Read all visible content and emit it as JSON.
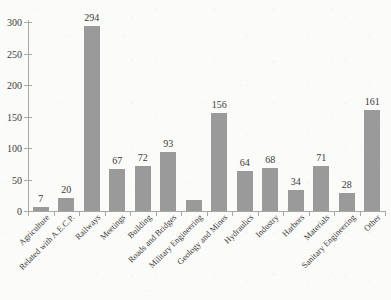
{
  "chart_data": {
    "type": "bar",
    "title": "",
    "xlabel": "",
    "ylabel": "",
    "ylim": [
      0,
      300
    ],
    "yticks": [
      0,
      50,
      100,
      150,
      200,
      250,
      300
    ],
    "grid": false,
    "legend": "none",
    "bar_color": "#9a9a9a",
    "categories": [
      "Agriculture",
      "Related with A.E.C.P.",
      "Railways",
      "Meetings",
      "Building",
      "Roads and Bridges",
      "Military Engineering",
      "Geology and Mines",
      "Hydraulics",
      "Industry",
      "Harbors",
      "Materials",
      "Sanitary Engineering",
      "Other"
    ],
    "values": [
      7,
      20,
      294,
      67,
      72,
      93,
      17,
      156,
      64,
      68,
      34,
      71,
      28,
      161
    ],
    "value_labels": [
      "7",
      "20",
      "294",
      "67",
      "72",
      "93",
      "",
      "156",
      "64",
      "68",
      "34",
      "71",
      "28",
      "161"
    ]
  }
}
